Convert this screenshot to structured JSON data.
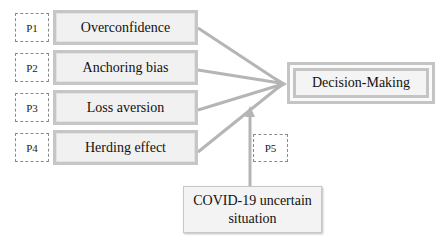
{
  "factors": [
    {
      "label": "P1",
      "name": "Overconfidence"
    },
    {
      "label": "P2",
      "name": "Anchoring bias"
    },
    {
      "label": "P3",
      "name": "Loss aversion"
    },
    {
      "label": "P4",
      "name": "Herding effect"
    }
  ],
  "outcome": {
    "name": "Decision-Making"
  },
  "moderator": {
    "label": "P5",
    "name": "COVID-19 uncertain situation"
  },
  "colors": {
    "arrow": "#b5b5b5",
    "box_border": "#c6c6c6",
    "box_fill": "#f1f1f1",
    "dashed": "#8a8a8a"
  }
}
